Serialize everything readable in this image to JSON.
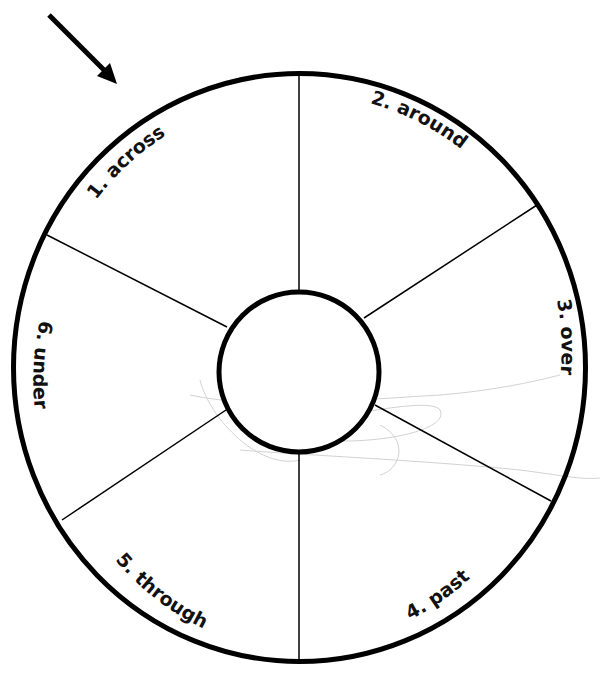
{
  "diagram": {
    "type": "segmented-wheel",
    "segments": [
      {
        "label": "1. across"
      },
      {
        "label": "2. around"
      },
      {
        "label": "3. over"
      },
      {
        "label": "4. past"
      },
      {
        "label": "5. through"
      },
      {
        "label": "6. under"
      }
    ],
    "center_label": "",
    "pointer": "arrow-pointing-to-segment-1",
    "colors": {
      "stroke": "#000000",
      "background": "#ffffff",
      "faint_scribble": "#cfcfcf"
    }
  }
}
